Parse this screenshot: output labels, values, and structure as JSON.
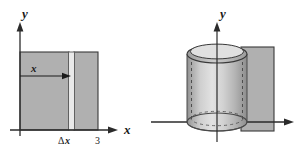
{
  "figure": {
    "type": "math-illustration",
    "background_color": "#ffffff"
  },
  "colors": {
    "region_fill": "#b0b0b0",
    "strip_fill": "#e6e6e6",
    "outline": "#3a3a3a",
    "axis": "#2b2b2b",
    "shell_light": "#d9d9d9",
    "shell_mid": "#bdbdbd",
    "shell_dark": "#9a9a9a",
    "text": "#1a1a1a"
  },
  "left_panel": {
    "name": "plane-region-diagram",
    "y_axis_label": "y",
    "x_axis_label": "x",
    "strip_distance_label": "x",
    "strip_width_label_delta": "Δ",
    "strip_width_label_var": "x",
    "x_tick_label": "3",
    "region": {
      "x_start": 0,
      "x_end": 3,
      "shape": "rectangle"
    },
    "strip": {
      "position_label": "x",
      "width_label": "Δx"
    }
  },
  "right_panel": {
    "name": "cylindrical-shell-diagram",
    "y_axis_label": "y",
    "x_axis_label": "",
    "shell": {
      "shape": "cylinder",
      "hidden_edges": "dashed",
      "top_face": "ellipse-annulus"
    },
    "outer_region_label": ""
  }
}
